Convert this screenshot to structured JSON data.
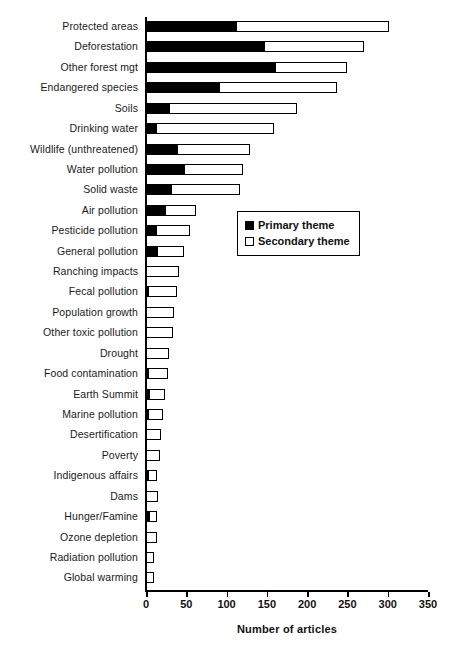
{
  "chart_data": {
    "type": "bar",
    "orientation": "horizontal",
    "stacked": true,
    "title": "",
    "xlabel": "Number of articles",
    "ylabel": "",
    "xlim": [
      0,
      350
    ],
    "xticks": [
      0,
      50,
      100,
      150,
      200,
      250,
      300,
      350
    ],
    "grid": false,
    "legend_position": "center-right-inside",
    "legend": [
      "Primary theme",
      "Secondary theme"
    ],
    "categories": [
      "Protected areas",
      "Deforestation",
      "Other forest mgt",
      "Endangered species",
      "Soils",
      "Drinking water",
      "Wildlife (unthreatened)",
      "Water pollution",
      "Solid waste",
      "Air pollution",
      "Pesticide pollution",
      "General pollution",
      "Ranching impacts",
      "Fecal pollution",
      "Population growth",
      "Other toxic pollution",
      "Drought",
      "Food contamination",
      "Earth Summit",
      "Marine pollution",
      "Desertification",
      "Poverty",
      "Indigenous affairs",
      "Dams",
      "Hunger/Famine",
      "Ozone depletion",
      "Radiation pollution",
      "Global warming"
    ],
    "series": [
      {
        "name": "Primary theme",
        "color": "#000000",
        "values": [
          112,
          146,
          160,
          91,
          29,
          13,
          38,
          47,
          31,
          23,
          13,
          14,
          0,
          3,
          0,
          0,
          0,
          2,
          4,
          3,
          0,
          0,
          2,
          0,
          4,
          0,
          0,
          0
        ]
      },
      {
        "name": "Secondary theme",
        "color": "#ffffff",
        "values": [
          190,
          125,
          90,
          146,
          159,
          146,
          91,
          73,
          86,
          39,
          41,
          33,
          41,
          36,
          35,
          33,
          28,
          25,
          19,
          18,
          19,
          17,
          12,
          15,
          10,
          14,
          10,
          10
        ]
      }
    ],
    "totals": [
      302,
      271,
      250,
      237,
      188,
      159,
      129,
      120,
      117,
      62,
      54,
      47,
      41,
      39,
      35,
      33,
      28,
      27,
      23,
      21,
      19,
      17,
      14,
      15,
      14,
      14,
      10,
      10
    ]
  },
  "legend": {
    "primary_label": "Primary theme",
    "secondary_label": "Secondary theme"
  },
  "axis": {
    "x_title": "Number of articles"
  }
}
